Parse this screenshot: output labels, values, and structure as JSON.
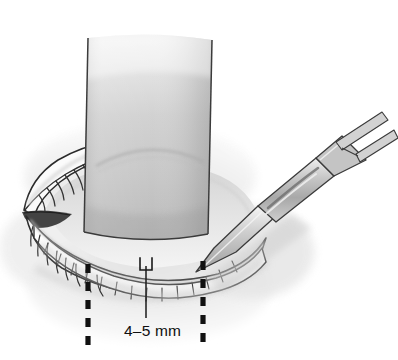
{
  "figure": {
    "view": "anterior, lower lid retracted with corneal protector in place",
    "background_color": "#ffffff"
  },
  "annotations": {
    "dimension_label": "4–5 mm",
    "dimension_label_plain": "4-5 mm",
    "dimension_value_min": 4,
    "dimension_value_max": 5,
    "dimension_units": "mm",
    "label_color": "#101010",
    "leader_line_color": "#1a1a1a",
    "marker_color": "#1a1a1a"
  },
  "guides": {
    "left_dashed_line": {
      "name": "left-extent-guide",
      "x": 88,
      "y_top": 264,
      "y_bottom": 347,
      "style": "dashed",
      "color": "#111111"
    },
    "right_dashed_line": {
      "name": "right-extent-guide",
      "x": 203,
      "y_top": 261,
      "y_bottom": 347,
      "style": "dashed",
      "color": "#111111"
    },
    "leader_line": {
      "name": "dimension-leader",
      "x": 146,
      "y_top": 266,
      "y_bottom": 318,
      "color": "#1a1a1a"
    },
    "depth_marker": {
      "name": "incision-depth-bracket",
      "x": 140,
      "y": 258,
      "width": 12,
      "height": 12
    }
  },
  "anatomy": {
    "upper_lid": {
      "name": "upper-eyelid",
      "lash_count": 9,
      "fill": "#fbfbfb",
      "stroke": "#2a2a2a"
    },
    "lower_lid": {
      "name": "lower-eyelid",
      "lash_count": 14,
      "fill": "#fcfcfc",
      "stroke": "#2a2a2a",
      "margin_band_fill": "#ffffff"
    },
    "medial_canthus": {
      "name": "medial-canthus",
      "fill": "#3a3a3a"
    },
    "periorbital_skin": {
      "name": "periorbital-skin",
      "fill": "#e9e9e9"
    },
    "globe_visible": {
      "name": "exposed-globe",
      "fill": "#e3e3e3"
    }
  },
  "instruments": {
    "corneal_protector": {
      "name": "corneal-protector-plate",
      "shape": "rounded rectangular plate",
      "fill_top": "#e0e0e0",
      "fill_mid": "#c9c9c9",
      "fill_bottom": "#b8b8b8",
      "stroke": "#3a3a3a",
      "has_limbus_arc": true
    },
    "scalpel": {
      "name": "scalpel",
      "orientation": "angled from lower-left to upper-right",
      "blade_fill": "#cfcfcf",
      "handle_fill": "#bdbdbd",
      "handle_stroke": "#3a3a3a",
      "handle_end": "forked",
      "tip_x": 196,
      "tip_y": 272
    }
  },
  "palette": {
    "ink": "#2a2a2a",
    "light_gray": "#e6e6e6",
    "mid_gray": "#c6c6c6",
    "dark_gray": "#8e8e8e",
    "near_black": "#111111",
    "white": "#ffffff"
  }
}
